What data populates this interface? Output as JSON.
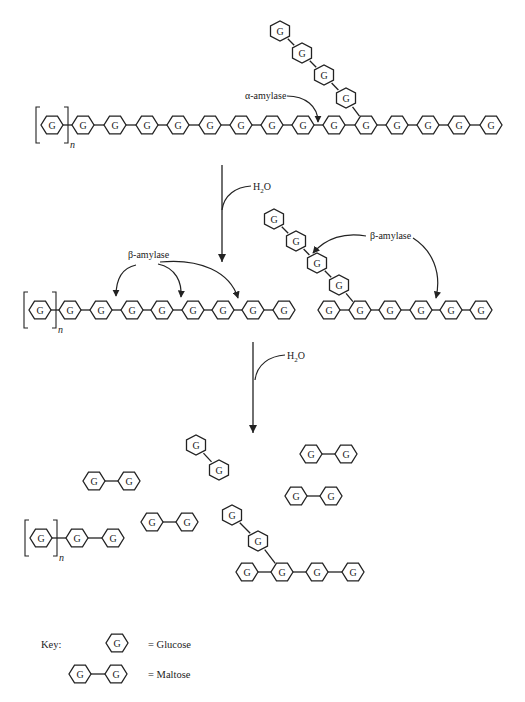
{
  "figure": {
    "hex_label": "G",
    "stroke_color": "#222222",
    "background": "#ffffff",
    "repeat_subscript": "n",
    "stages": [
      {
        "id": "stage1-amylopectin",
        "bracketed": {
          "x": 52,
          "y": 125
        },
        "main_chain": [
          {
            "x": 83,
            "y": 125
          },
          {
            "x": 115,
            "y": 125
          },
          {
            "x": 147,
            "y": 125
          },
          {
            "x": 178,
            "y": 125
          },
          {
            "x": 210,
            "y": 125
          },
          {
            "x": 241,
            "y": 125
          },
          {
            "x": 272,
            "y": 125
          },
          {
            "x": 303,
            "y": 125
          },
          {
            "x": 334,
            "y": 125
          },
          {
            "x": 366,
            "y": 125
          },
          {
            "x": 397,
            "y": 125
          },
          {
            "x": 428,
            "y": 125
          },
          {
            "x": 459,
            "y": 125
          },
          {
            "x": 491,
            "y": 125
          }
        ],
        "branch": [
          {
            "x": 346,
            "y": 98
          },
          {
            "x": 324,
            "y": 75
          },
          {
            "x": 302,
            "y": 53
          },
          {
            "x": 280,
            "y": 31
          }
        ],
        "branch_root": {
          "x": 366,
          "y": 125
        }
      },
      {
        "id": "stage2-left-chain",
        "bracketed": {
          "x": 40,
          "y": 310
        },
        "main_chain": [
          {
            "x": 70,
            "y": 310
          },
          {
            "x": 101,
            "y": 310
          },
          {
            "x": 132,
            "y": 310
          },
          {
            "x": 162,
            "y": 310
          },
          {
            "x": 193,
            "y": 310
          },
          {
            "x": 223,
            "y": 310
          },
          {
            "x": 253,
            "y": 310
          },
          {
            "x": 284,
            "y": 310
          }
        ]
      },
      {
        "id": "stage2-right-chain",
        "main_chain": [
          {
            "x": 329,
            "y": 310
          },
          {
            "x": 360,
            "y": 310
          },
          {
            "x": 390,
            "y": 310
          },
          {
            "x": 421,
            "y": 310
          },
          {
            "x": 451,
            "y": 310
          },
          {
            "x": 481,
            "y": 310
          }
        ],
        "branch": [
          {
            "x": 339,
            "y": 285
          },
          {
            "x": 317,
            "y": 263
          },
          {
            "x": 296,
            "y": 241
          },
          {
            "x": 274,
            "y": 219
          }
        ],
        "branch_root": {
          "x": 360,
          "y": 310
        }
      },
      {
        "id": "stage3-products",
        "maltose_units": [
          {
            "x1": 94,
            "x2": 129,
            "y": 481
          },
          {
            "x1": 152,
            "x2": 187,
            "y": 522
          },
          {
            "x1": 311,
            "x2": 346,
            "y": 454
          },
          {
            "x1": 296,
            "x2": 331,
            "y": 496
          }
        ],
        "angled_maltose": [
          {
            "x": 196,
            "y": 445
          },
          {
            "x": 219,
            "y": 470
          }
        ],
        "bracketed_remnant": {
          "bracketed": {
            "x": 41,
            "y": 538
          },
          "main_chain": [
            {
              "x": 77,
              "y": 538
            },
            {
              "x": 113,
              "y": 538
            }
          ]
        },
        "limit_dextrin": {
          "main_chain": [
            {
              "x": 247,
              "y": 572
            },
            {
              "x": 282,
              "y": 572
            },
            {
              "x": 317,
              "y": 572
            },
            {
              "x": 353,
              "y": 572
            }
          ],
          "branch": [
            {
              "x": 258,
              "y": 541
            },
            {
              "x": 232,
              "y": 515
            }
          ],
          "branch_root": {
            "x": 282,
            "y": 572
          }
        }
      }
    ],
    "arrows": {
      "reaction_1": {
        "x": 222,
        "y1": 165,
        "y2": 262
      },
      "reaction_2": {
        "x": 253,
        "y1": 342,
        "y2": 433
      }
    },
    "labels": {
      "alpha_amylase": "α-amylase",
      "beta_amylase_left": "β-amylase",
      "beta_amylase_right": "β-amylase",
      "water_1_main": "H",
      "water_1_sub": "2",
      "water_1_tail": "O",
      "water_2_main": "H",
      "water_2_sub": "2",
      "water_2_tail": "O"
    },
    "key": {
      "title": "Key:",
      "glucose_label": "= Glucose",
      "maltose_label": "= Maltose"
    }
  }
}
